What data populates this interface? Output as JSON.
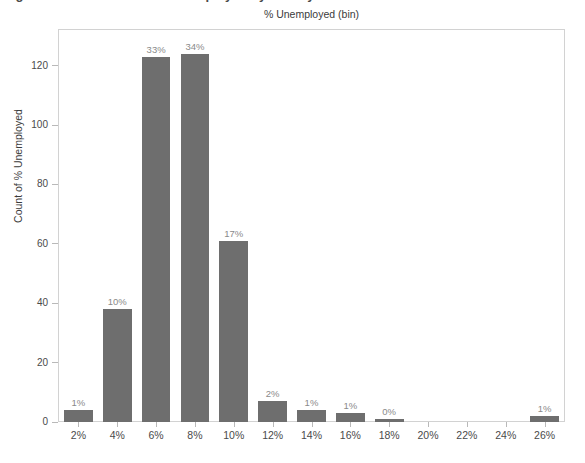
{
  "clipped_heading": "Figure 4. Distribution of % Unemployed by County",
  "chart_data": {
    "type": "bar",
    "title": "% Unemployed (bin)",
    "xlabel": "",
    "ylabel": "Count of % Unemployed",
    "categories": [
      "2%",
      "4%",
      "6%",
      "8%",
      "10%",
      "12%",
      "14%",
      "16%",
      "18%",
      "20%",
      "22%",
      "24%",
      "26%"
    ],
    "values": [
      4,
      38,
      123,
      124,
      61,
      7,
      4,
      3,
      1,
      0,
      0,
      0,
      2
    ],
    "data_labels": [
      "1%",
      "10%",
      "33%",
      "34%",
      "17%",
      "2%",
      "1%",
      "1%",
      "0%",
      "",
      "",
      "",
      "1%"
    ],
    "yticks": [
      0,
      20,
      40,
      60,
      80,
      100,
      120
    ],
    "ylim": [
      0,
      132
    ],
    "grid": false,
    "legend": "none",
    "bar_color": "#6e6e6e",
    "data_label_color": "#8a8a8a",
    "axis_text_color": "#4a4a4a"
  }
}
